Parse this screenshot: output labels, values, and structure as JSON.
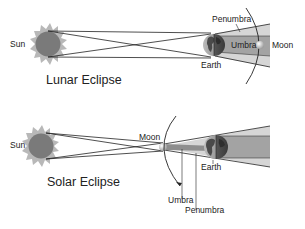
{
  "lunar": {
    "title": "Lunar Eclipse",
    "labels": {
      "sun": "Sun",
      "earth": "Earth",
      "moon": "Moon",
      "umbra": "Umbra",
      "penumbra": "Penumbra"
    }
  },
  "solar": {
    "title": "Solar Eclipse",
    "labels": {
      "sun": "Sun",
      "earth": "Earth",
      "moon": "Moon",
      "umbra": "Umbra",
      "penumbra": "Penumbra"
    }
  },
  "colors": {
    "sun_body": "#7a7a7a",
    "sun_corona": "#b5b5b5",
    "penumbra": "#d6d6d6",
    "umbra": "#9e9e9e",
    "earth_land": "#4a4a4a",
    "earth_sea": "#8a8a8a",
    "lines": "#222222"
  }
}
